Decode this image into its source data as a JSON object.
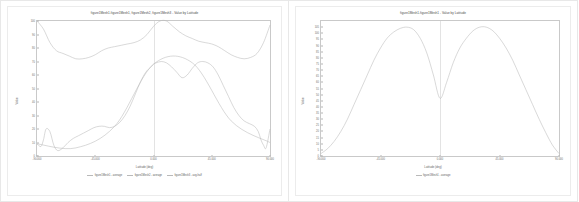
{
  "chart_data": [
    {
      "type": "line",
      "title": "figure1Mesh1-figure1Mesh1, figure1Mesh2, figure1Mesh3 - Value by Latitude",
      "xlabel": "Latitude (deg)",
      "ylabel": "Value",
      "xlim": [
        -90,
        90
      ],
      "ylim": [
        0,
        100
      ],
      "grid": false,
      "legend_position": "bottom",
      "xticks": [
        "-90.000",
        "-45.000",
        "0.000",
        "45.000",
        "90.000"
      ],
      "xtick_values": [
        -90,
        -45,
        0,
        45,
        90
      ],
      "yticks": [
        "0",
        "10",
        "20",
        "30",
        "40",
        "50",
        "60",
        "70",
        "80",
        "90",
        "100"
      ],
      "ytick_values": [
        0,
        10,
        20,
        30,
        40,
        50,
        60,
        70,
        80,
        90,
        100
      ],
      "series": [
        {
          "name": "figure1Mesh1 - average",
          "color": "#b9b9b9",
          "x": [
            -90,
            -85,
            -80,
            -75,
            -70,
            -65,
            -60,
            -55,
            -50,
            -45,
            -40,
            -35,
            -30,
            -25,
            -20,
            -15,
            -10,
            -5,
            0,
            5,
            10,
            15,
            20,
            25,
            30,
            35,
            40,
            45,
            50,
            55,
            60,
            65,
            70,
            75,
            80,
            85,
            90
          ],
          "values": [
            100,
            94,
            84,
            78,
            76,
            74,
            72,
            72,
            73,
            75,
            78,
            80,
            81,
            82,
            83,
            84,
            86,
            90,
            96,
            100,
            100,
            96,
            92,
            89,
            87,
            85,
            84,
            83,
            81,
            78,
            75,
            73,
            72,
            73,
            76,
            84,
            97
          ]
        },
        {
          "name": "figure1Mesh2 - average",
          "color": "#b9b9b9",
          "x": [
            -90,
            -87,
            -85,
            -83,
            -80,
            -77,
            -74,
            -70,
            -66,
            -62,
            -58,
            -54,
            -50,
            -46,
            -42,
            -38,
            -34,
            -30,
            -26,
            -22,
            -18,
            -14,
            -10,
            -6,
            -2,
            0,
            2,
            6,
            10,
            14,
            18,
            22,
            26,
            30,
            34,
            38,
            42,
            46,
            50,
            54,
            58,
            62,
            66,
            70,
            74,
            78,
            81,
            83,
            85,
            87,
            90
          ],
          "values": [
            9,
            7,
            12,
            20,
            18,
            8,
            4,
            6,
            10,
            13,
            15,
            17,
            19,
            21,
            22,
            22,
            21,
            22,
            25,
            30,
            37,
            46,
            55,
            62,
            66,
            68,
            69,
            70,
            69,
            66,
            62,
            58,
            60,
            65,
            69,
            70,
            69,
            66,
            60,
            52,
            44,
            36,
            30,
            26,
            24,
            22,
            18,
            12,
            8,
            6,
            20
          ]
        },
        {
          "name": "figure1Mesh3 - avg-half",
          "color": "#b9b9b9",
          "x": [
            -90,
            -60,
            -30,
            0,
            30,
            60,
            90
          ],
          "values": [
            9,
            6,
            22,
            68,
            69,
            26,
            10
          ]
        }
      ]
    },
    {
      "type": "line",
      "title": "figure1Mesh1-figure1Mesh1 - Value by Latitude",
      "xlabel": "Latitude (deg)",
      "ylabel": "Value",
      "xlim": [
        -90,
        90
      ],
      "ylim": [
        0,
        110
      ],
      "grid": false,
      "legend_position": "bottom",
      "xticks": [
        "-90.000",
        "-45.000",
        "0.000",
        "45.000",
        "90.000"
      ],
      "xtick_values": [
        -90,
        -45,
        0,
        45,
        90
      ],
      "yticks": [
        "0",
        "5",
        "10",
        "15",
        "20",
        "25",
        "30",
        "35",
        "40",
        "45",
        "50",
        "55",
        "60",
        "65",
        "70",
        "75",
        "80",
        "85",
        "90",
        "95",
        "100",
        "105"
      ],
      "ytick_values": [
        0,
        5,
        10,
        15,
        20,
        25,
        30,
        35,
        40,
        45,
        50,
        55,
        60,
        65,
        70,
        75,
        80,
        85,
        90,
        95,
        100,
        105
      ],
      "series": [
        {
          "name": "figure1Mesh1 - average",
          "color": "#b9b9b9",
          "x": [
            -90,
            -85,
            -80,
            -75,
            -70,
            -65,
            -60,
            -55,
            -50,
            -45,
            -40,
            -35,
            -30,
            -25,
            -20,
            -15,
            -10,
            -5,
            0,
            5,
            10,
            15,
            20,
            25,
            30,
            35,
            40,
            45,
            50,
            55,
            60,
            65,
            70,
            75,
            80,
            85,
            90
          ],
          "values": [
            2,
            6,
            12,
            20,
            30,
            42,
            54,
            66,
            78,
            88,
            96,
            101,
            104,
            105,
            103,
            96,
            84,
            66,
            47,
            60,
            76,
            88,
            96,
            102,
            105,
            105,
            102,
            96,
            88,
            78,
            66,
            54,
            42,
            30,
            19,
            9,
            2
          ]
        }
      ]
    }
  ]
}
